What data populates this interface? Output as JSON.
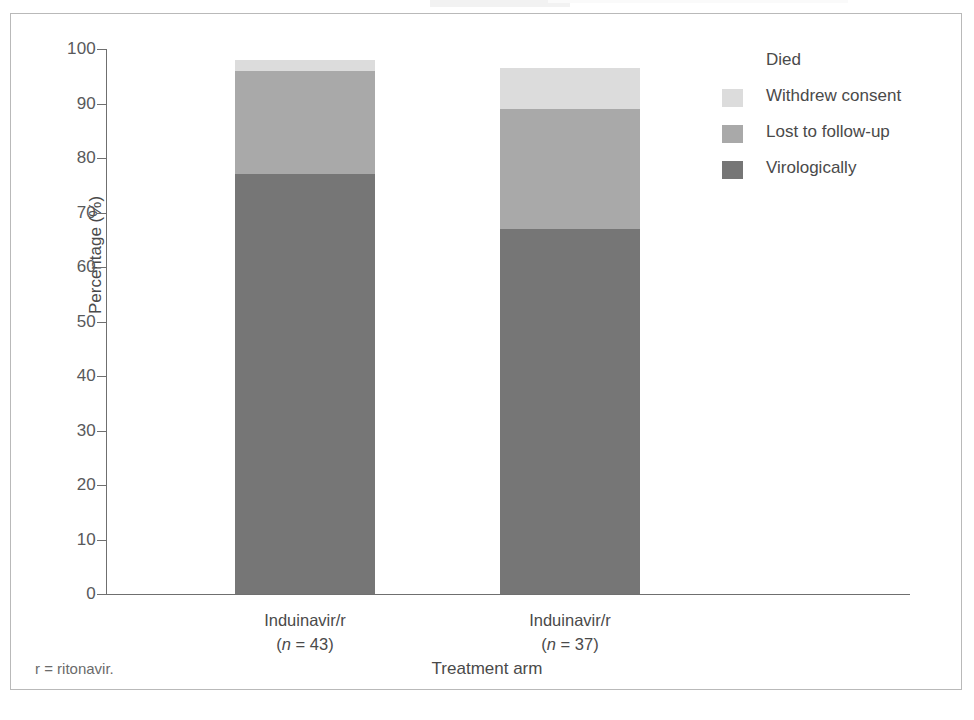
{
  "figure": {
    "footnote": "r = ritonavir."
  },
  "chart_data": {
    "type": "bar",
    "subtype": "stacked-bar",
    "title": "",
    "xlabel": "Treatment arm",
    "ylabel": "Percentage (%)",
    "ylim": [
      0,
      100
    ],
    "ytick_values": [
      0,
      10,
      20,
      30,
      40,
      50,
      60,
      70,
      80,
      90,
      100
    ],
    "ytick_labels": [
      "0",
      "10",
      "20",
      "30",
      "40",
      "50",
      "60",
      "70",
      "80",
      "90",
      "100"
    ],
    "grid": false,
    "legend_position": "right",
    "categories": [
      "Induinavir/r",
      "Induinavir/r"
    ],
    "category_labels": [
      {
        "name": "Induinavir/r",
        "n_text": "(n = 43)",
        "n": 43
      },
      {
        "name": "Induinavir/r",
        "n_text": "(n = 37)",
        "n": 37
      }
    ],
    "series": [
      {
        "name": "Virologically",
        "color": "#767676",
        "values": [
          77,
          67
        ]
      },
      {
        "name": "Lost to follow-up",
        "color": "#a9a9a9",
        "values": [
          19,
          22
        ]
      },
      {
        "name": "Withdrew consent",
        "color": "#dcdcdc",
        "values": [
          2,
          7.5
        ]
      },
      {
        "name": "Died",
        "color": "#ffffff",
        "values": [
          0,
          0
        ]
      }
    ],
    "stack_tops": [
      98,
      96.5
    ],
    "legend_entries": [
      {
        "label": "Died",
        "color": "#ffffff"
      },
      {
        "label": "Withdrew consent",
        "color": "#dcdcdc"
      },
      {
        "label": "Lost to follow-up",
        "color": "#a9a9a9"
      },
      {
        "label": "Virologically",
        "color": "#767676"
      }
    ]
  }
}
